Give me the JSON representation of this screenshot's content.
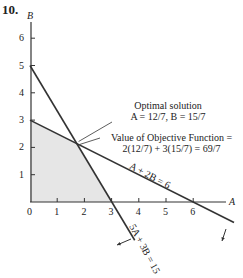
{
  "problem_number": "10.",
  "chart_data": {
    "type": "line",
    "title": "",
    "xlabel": "A",
    "ylabel": "B",
    "xlim": [
      0,
      7
    ],
    "ylim": [
      0,
      6.5
    ],
    "x_ticks": [
      0,
      1,
      2,
      3,
      4,
      5,
      6
    ],
    "y_ticks": [
      1,
      2,
      3,
      4,
      5,
      6
    ],
    "grid": false,
    "legend": null,
    "series": [
      {
        "name": "A + 2B = 6",
        "points": [
          [
            0,
            3
          ],
          [
            6,
            0
          ]
        ],
        "extends_to": [
          7.5,
          -0.75
        ],
        "feasible_side_arrow": "down-left"
      },
      {
        "name": "5A + 3B = 15",
        "points": [
          [
            0,
            5
          ],
          [
            3,
            0
          ]
        ],
        "extends_to": [
          3.85,
          -1.4
        ],
        "feasible_side_arrow": "down-left"
      }
    ],
    "feasible_region": {
      "fill": "#e6e6e6",
      "vertices": [
        [
          0,
          0
        ],
        [
          0,
          3
        ],
        [
          1.714,
          2.143
        ],
        [
          3,
          0
        ]
      ]
    },
    "optimal_point": {
      "A": "12/7",
      "B": "15/7",
      "x": 1.714,
      "y": 2.143
    },
    "annotations": [
      {
        "text": "Optimal solution",
        "line2": "A = 12/7, B = 15/7"
      },
      {
        "text": "Value of Objective Function =",
        "line2": "2(12/7) + 3(15/7) = 69/7"
      }
    ]
  },
  "labels": {
    "axis_x": "A",
    "axis_y": "B",
    "x_ticks": [
      "0",
      "1",
      "2",
      "3",
      "4",
      "5",
      "6"
    ],
    "y_ticks": [
      "1",
      "2",
      "3",
      "4",
      "5",
      "6"
    ],
    "optimal_title": "Optimal solution",
    "optimal_values": "A = 12/7, B = 15/7",
    "objective_title": "Value of Objective Function =",
    "objective_calc": "2(12/7) + 3(15/7) = 69/7",
    "constraint1": "A + 2B = 6",
    "constraint2": "5A + 3B = 15"
  },
  "colors": {
    "line": "#333333",
    "fill": "#e6e6e6",
    "text": "#222222"
  }
}
